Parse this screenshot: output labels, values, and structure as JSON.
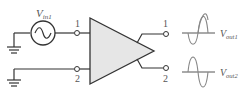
{
  "diagram": {
    "type": "differential-amplifier-circuit",
    "source": {
      "label_main": "V",
      "label_sub": "in1"
    },
    "inputs": [
      {
        "pin": "1"
      },
      {
        "pin": "2"
      }
    ],
    "outputs": [
      {
        "pin": "1",
        "label_main": "V",
        "label_sub": "out1",
        "waveform": "sine-inverted"
      },
      {
        "pin": "2",
        "label_main": "V",
        "label_sub": "out2",
        "waveform": "sine"
      }
    ],
    "colors": {
      "line": "#333333",
      "amp_fill": "#e6e6e6",
      "wave": "#888888",
      "text": "#555555"
    }
  }
}
